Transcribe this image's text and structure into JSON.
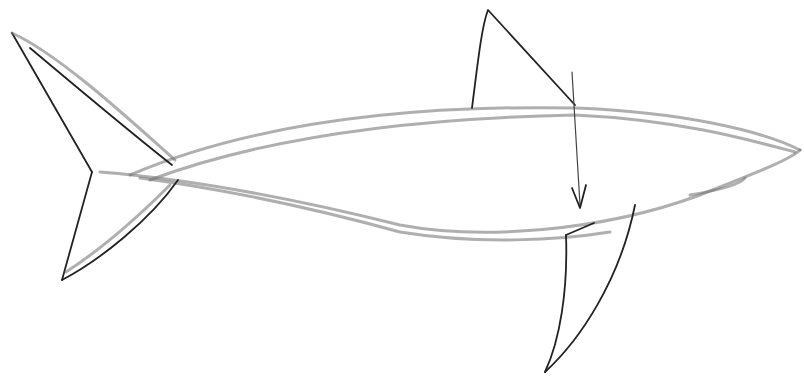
{
  "image": {
    "subject": "pencil sketch of a shark",
    "background_color": "#ffffff",
    "stroke_color": "#222222",
    "elements": [
      {
        "name": "body-outline-top",
        "path": "M130 175 C 260 120, 420 105, 575 108 C 680 112, 760 130, 800 150"
      },
      {
        "name": "body-outline-bottom",
        "path": "M100 172 C 200 180, 300 200, 400 225 C 480 240, 600 232, 700 195 C 750 175, 790 160, 800 150"
      },
      {
        "name": "tail-upper-lobe",
        "path": "M12 33 L 92 172 M12 33 C 60 55, 130 120, 175 160"
      },
      {
        "name": "tail-lower-lobe",
        "path": "M92 172 L 62 280 M62 280 C 100 260, 150 220, 178 180"
      },
      {
        "name": "dorsal-fin",
        "path": "M472 108 C 478 60, 482 25, 488 10 L 575 105"
      },
      {
        "name": "pectoral-fin",
        "path": "M566 235 C 568 290, 560 340, 545 372 C 580 340, 620 280, 635 205"
      },
      {
        "name": "arrow-shaft",
        "path": "M572 72 L 580 205"
      },
      {
        "name": "arrow-head",
        "path": "M572 188 L 580 208 L 586 185"
      },
      {
        "name": "gill-mark",
        "path": "M566 235 L 594 223"
      }
    ]
  }
}
